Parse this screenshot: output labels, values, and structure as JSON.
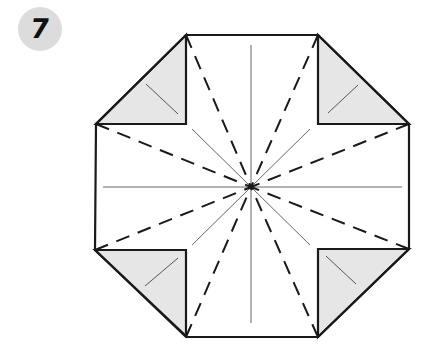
{
  "step": {
    "number": "7",
    "badge_color": "#dcdcdc"
  },
  "diagram": {
    "shape": "octagon with folded corner flaps",
    "colors": {
      "outline": "#1a1a1a",
      "flap_fill": "#e6e6e6",
      "crease": "#555555"
    },
    "octagon_points": [
      [
        186,
        35
      ],
      [
        318,
        35
      ],
      [
        409,
        124
      ],
      [
        409,
        249
      ],
      [
        318,
        337
      ],
      [
        186,
        337
      ],
      [
        95,
        250
      ],
      [
        96,
        124
      ]
    ],
    "center": [
      251,
      187
    ],
    "flaps": [
      {
        "name": "top-left",
        "points": [
          [
            186,
            35
          ],
          [
            96,
            124
          ],
          [
            186,
            124
          ]
        ],
        "crease": [
          [
            146,
            84
          ],
          [
            178,
            114
          ]
        ]
      },
      {
        "name": "top-right",
        "points": [
          [
            318,
            35
          ],
          [
            409,
            124
          ],
          [
            318,
            124
          ]
        ],
        "crease": [
          [
            328,
            113
          ],
          [
            358,
            85
          ]
        ]
      },
      {
        "name": "bottom-left",
        "points": [
          [
            95,
            250
          ],
          [
            186,
            336
          ],
          [
            186,
            250
          ]
        ],
        "crease": [
          [
            145,
            286
          ],
          [
            178,
            258
          ]
        ]
      },
      {
        "name": "bottom-right",
        "points": [
          [
            409,
            249
          ],
          [
            318,
            337
          ],
          [
            318,
            249
          ]
        ],
        "crease": [
          [
            326,
            256
          ],
          [
            356,
            284
          ]
        ]
      }
    ],
    "thin_lines": [
      [
        [
          251,
          45
        ],
        [
          251,
          323
        ]
      ],
      [
        [
          103,
          187
        ],
        [
          402,
          187
        ]
      ],
      [
        [
          192,
          129
        ],
        [
          251,
          187
        ]
      ],
      [
        [
          310,
          129
        ],
        [
          251,
          187
        ]
      ],
      [
        [
          192,
          245
        ],
        [
          251,
          187
        ]
      ],
      [
        [
          310,
          245
        ],
        [
          251,
          187
        ]
      ]
    ],
    "dashed_lines_to_center_from": [
      [
        186,
        35
      ],
      [
        318,
        35
      ],
      [
        409,
        124
      ],
      [
        409,
        249
      ],
      [
        318,
        337
      ],
      [
        186,
        337
      ],
      [
        95,
        250
      ],
      [
        96,
        124
      ]
    ]
  }
}
